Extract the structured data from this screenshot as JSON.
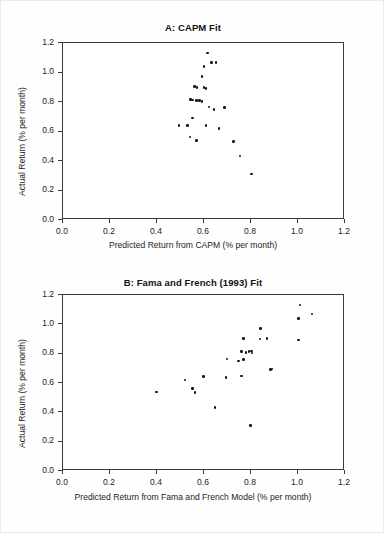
{
  "figure": {
    "background_color": "#fefefe",
    "point_color": "#141414",
    "axis_color": "#3a3a3a"
  },
  "chart_data": [
    {
      "type": "scatter",
      "panel": "A",
      "title": "A: CAPM Fit",
      "xlabel": "Predicted Return from CAPM (% per month)",
      "ylabel": "Actual Return (% per month)",
      "xlim": [
        0.0,
        1.2
      ],
      "ylim": [
        0.0,
        1.2
      ],
      "xticks": [
        "0.0",
        "0.2",
        "0.4",
        "0.6",
        "0.8",
        "1.0",
        "1.2"
      ],
      "xtick_values": [
        0.0,
        0.2,
        0.4,
        0.6,
        0.8,
        1.0,
        1.2
      ],
      "yticks": [
        "0.0",
        "0.2",
        "0.4",
        "0.6",
        "0.8",
        "1.0",
        "1.2"
      ],
      "ytick_values": [
        0.0,
        0.2,
        0.4,
        0.6,
        0.8,
        1.0,
        1.2
      ],
      "grid": false,
      "legend": "none",
      "n_points": 25,
      "x": [
        0.62,
        0.635,
        0.605,
        0.655,
        0.595,
        0.565,
        0.575,
        0.605,
        0.612,
        0.548,
        0.556,
        0.572,
        0.585,
        0.596,
        0.625,
        0.646,
        0.692,
        0.556,
        0.535,
        0.613,
        0.668,
        0.545,
        0.572,
        0.731,
        0.757,
        0.806,
        0.497
      ],
      "y": [
        1.125,
        1.063,
        1.033,
        1.063,
        0.965,
        0.898,
        0.893,
        0.893,
        0.886,
        0.812,
        0.806,
        0.803,
        0.803,
        0.797,
        0.758,
        0.742,
        0.754,
        0.686,
        0.635,
        0.633,
        0.613,
        0.556,
        0.531,
        0.527,
        0.428,
        0.305,
        0.635
      ]
    },
    {
      "type": "scatter",
      "panel": "B",
      "title": "B: Fama and French (1993) Fit",
      "xlabel": "Predicted Return from Fama and French Model (% per month)",
      "ylabel": "Actual Return (% per month)",
      "xlim": [
        0.0,
        1.2
      ],
      "ylim": [
        0.0,
        1.2
      ],
      "xticks": [
        "0.0",
        "0.2",
        "0.4",
        "0.6",
        "0.8",
        "1.0",
        "1.2"
      ],
      "xtick_values": [
        0.0,
        0.2,
        0.4,
        0.6,
        0.8,
        1.0,
        1.2
      ],
      "yticks": [
        "0.0",
        "0.2",
        "0.4",
        "0.6",
        "0.8",
        "1.0",
        "1.2"
      ],
      "ytick_values": [
        0.0,
        0.2,
        0.4,
        0.6,
        0.8,
        1.0,
        1.2
      ],
      "grid": false,
      "legend": "none",
      "n_points": 25,
      "x": [
        1.012,
        1.063,
        1.006,
        0.845,
        1.006,
        0.773,
        0.842,
        0.872,
        0.796,
        0.783,
        0.764,
        0.806,
        0.809,
        0.702,
        0.752,
        0.773,
        0.886,
        0.601,
        0.524,
        0.698,
        0.764,
        0.556,
        0.566,
        0.893,
        0.651,
        0.803,
        0.401
      ],
      "y": [
        1.125,
        1.063,
        1.033,
        0.965,
        0.886,
        0.898,
        0.893,
        0.898,
        0.806,
        0.803,
        0.806,
        0.812,
        0.797,
        0.758,
        0.742,
        0.754,
        0.686,
        0.636,
        0.613,
        0.63,
        0.64,
        0.556,
        0.527,
        0.688,
        0.428,
        0.305,
        0.531
      ]
    }
  ],
  "panel_a": {
    "title": "A: CAPM Fit",
    "xlabel": "Predicted Return from CAPM (% per month)",
    "ylabel": "Actual Return (% per month)",
    "xtick_labels": [
      "0.0",
      "0.2",
      "0.4",
      "0.6",
      "0.8",
      "1.0",
      "1.2"
    ],
    "ytick_labels": [
      "0.0",
      "0.2",
      "0.4",
      "0.6",
      "0.8",
      "1.0",
      "1.2"
    ]
  },
  "panel_b": {
    "title": "B: Fama and French (1993) Fit",
    "xlabel": "Predicted Return from Fama and French Model (% per month)",
    "ylabel": "Actual Return (% per month)",
    "xtick_labels": [
      "0.0",
      "0.2",
      "0.4",
      "0.6",
      "0.8",
      "1.0",
      "1.2"
    ],
    "ytick_labels": [
      "0.0",
      "0.2",
      "0.4",
      "0.6",
      "0.8",
      "1.0",
      "1.2"
    ]
  }
}
